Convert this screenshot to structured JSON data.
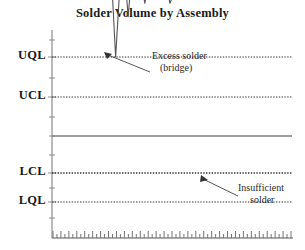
{
  "chart_title": "Solder Volume by Assembly",
  "axis_labels": [
    {
      "name": "uql",
      "text": "UQL",
      "y": 57
    },
    {
      "name": "ucl",
      "text": "UCL",
      "y": 97
    },
    {
      "name": "lcl",
      "text": "LCL",
      "y": 173
    },
    {
      "name": "lql",
      "text": "LQL",
      "y": 202
    }
  ],
  "annotations": [
    {
      "name": "excess-solder",
      "line1": "Excess solder",
      "line2": "(bridge)",
      "x": 152,
      "y": 50
    },
    {
      "name": "insufficient-solder",
      "line1": "Insufficient",
      "line2": "solder",
      "x": 238,
      "y": 184
    }
  ],
  "colors": {
    "series": "#555555",
    "limit_line": "#333333",
    "center_line": "#777777",
    "axis": "#888888",
    "text": "#1a1a1a"
  },
  "chart_data": {
    "type": "line",
    "title": "Solder Volume by Assembly",
    "xlabel": "",
    "ylabel": "",
    "grid": false,
    "legend": "none",
    "x_axis": {
      "min": 0,
      "max": 60,
      "ticks": 60,
      "tick_labels": []
    },
    "y_axis": {
      "min": 0,
      "max": 100,
      "tick_labels": [
        "LQL",
        "LCL",
        "UCL",
        "UQL"
      ],
      "reference_lines": [
        {
          "label": "UQL",
          "value": 86,
          "style": "dotted"
        },
        {
          "label": "UCL",
          "value": 71,
          "style": "dotted"
        },
        {
          "label": "CL",
          "value": 57,
          "style": "solid"
        },
        {
          "label": "LCL",
          "value": 43,
          "style": "dotted"
        },
        {
          "label": "LQL",
          "value": 32,
          "style": "dotted"
        }
      ]
    },
    "series": [
      {
        "name": "Solder Volume",
        "values": [
          64,
          57,
          52,
          60,
          50,
          62,
          55,
          43,
          37,
          49,
          56,
          53,
          57,
          58,
          56,
          86,
          60,
          51,
          71,
          52,
          62,
          57,
          66,
          56,
          52,
          60,
          54,
          58,
          66,
          62,
          58,
          47,
          51,
          42,
          55,
          60,
          49,
          57,
          64,
          53,
          60,
          56,
          41,
          53,
          56,
          50,
          57,
          54,
          58,
          50,
          53,
          57,
          48,
          44,
          51,
          49,
          43,
          55
        ]
      }
    ],
    "annotated_points": [
      {
        "label": "Excess solder (bridge)",
        "index": 15,
        "value": 86
      },
      {
        "label": "Insufficient solder",
        "index": 42,
        "value": 41
      }
    ]
  }
}
